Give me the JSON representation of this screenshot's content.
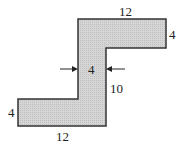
{
  "diagram": {
    "shape_fill": "#cfcfcf",
    "stroke_color": "#333333",
    "dimensions": {
      "top_width": "12",
      "top_right_height": "4",
      "web_width": "4",
      "web_height": "10",
      "bottom_left_height": "4",
      "bottom_width": "12"
    }
  }
}
